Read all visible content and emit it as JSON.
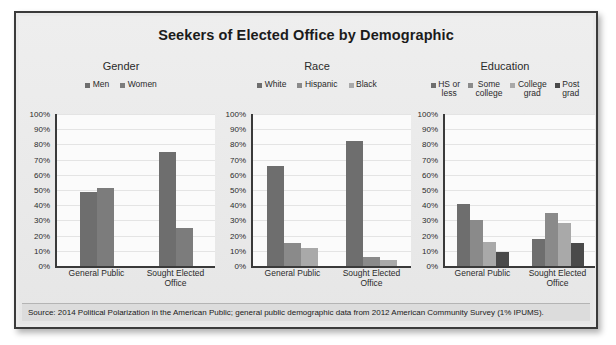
{
  "figure": {
    "title": "Seekers of Elected Office by Demographic",
    "source": "Source: 2014 Political Polarization in the American Public; general public demographic data from 2012 American Community Survey (1% IPUMS).",
    "frame_color": "#3a3a3a",
    "background_color": "#e9e9e9",
    "plot_background_color": "#fbfbfb"
  },
  "axis": {
    "ticks": [
      "100%",
      "90%",
      "80%",
      "70%",
      "60%",
      "50%",
      "40%",
      "30%",
      "20%",
      "10%",
      "0%"
    ],
    "ymin": 0,
    "ymax": 100
  },
  "categories": [
    "General Public",
    "Sought Elected\nOffice"
  ],
  "chart_data": [
    {
      "type": "bar",
      "title": "Gender",
      "categories": [
        "General Public",
        "Sought Elected Office"
      ],
      "series": [
        {
          "name": "Men",
          "values": [
            49,
            75
          ],
          "color": "#6e6e6e"
        },
        {
          "name": "Women",
          "values": [
            51,
            25
          ],
          "color": "#7c7c7c"
        }
      ],
      "xlabel": "",
      "ylabel": "",
      "ylim": [
        0,
        100
      ],
      "grid": true,
      "legend_position": "top"
    },
    {
      "type": "bar",
      "title": "Race",
      "categories": [
        "General Public",
        "Sought Elected Office"
      ],
      "series": [
        {
          "name": "White",
          "values": [
            66,
            82
          ],
          "color": "#6e6e6e"
        },
        {
          "name": "Hispanic",
          "values": [
            15,
            6
          ],
          "color": "#8a8a8a"
        },
        {
          "name": "Black",
          "values": [
            12,
            4
          ],
          "color": "#a9a9a9"
        }
      ],
      "xlabel": "",
      "ylabel": "",
      "ylim": [
        0,
        100
      ],
      "grid": true,
      "legend_position": "top"
    },
    {
      "type": "bar",
      "title": "Education",
      "categories": [
        "General Public",
        "Sought Elected Office"
      ],
      "series": [
        {
          "name": "HS or\nless",
          "values": [
            41,
            18
          ],
          "color": "#6e6e6e"
        },
        {
          "name": "Some\ncollege",
          "values": [
            30,
            35
          ],
          "color": "#8a8a8a"
        },
        {
          "name": "College\ngrad",
          "values": [
            16,
            28
          ],
          "color": "#a9a9a9"
        },
        {
          "name": "Post\ngrad",
          "values": [
            9,
            15
          ],
          "color": "#4a4a4a"
        }
      ],
      "xlabel": "",
      "ylabel": "",
      "ylim": [
        0,
        100
      ],
      "grid": true,
      "legend_position": "top"
    }
  ]
}
